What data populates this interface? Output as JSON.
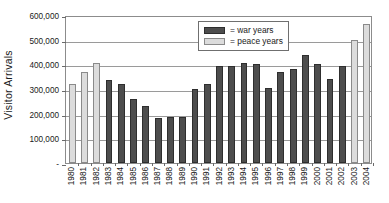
{
  "chart_data": {
    "type": "bar",
    "title": "",
    "subtitle": "",
    "xlabel": "",
    "ylabel": "Visitor Arrivals",
    "ylim": [
      0,
      600000
    ],
    "ytick_labels": [
      "600,000",
      "500,000",
      "400,000",
      "300,000",
      "200,000",
      "100,000",
      "-"
    ],
    "ytick_values": [
      600000,
      500000,
      400000,
      300000,
      200000,
      100000,
      0
    ],
    "grid": "horizontal",
    "legend_position": "upper-center",
    "legend": [
      {
        "key": "war",
        "label": "= war years",
        "color": "#4d4d4d"
      },
      {
        "key": "peace",
        "label": "= peace years",
        "color": "#dcdcdc"
      }
    ],
    "categories": [
      "1980",
      "1981",
      "1982",
      "1983",
      "1984",
      "1985",
      "1986",
      "1987",
      "1988",
      "1989",
      "1990",
      "1991",
      "1992",
      "1993",
      "1994",
      "1995",
      "1996",
      "1997",
      "1998",
      "1999",
      "2000",
      "2001",
      "2002",
      "2003",
      "2004"
    ],
    "values": [
      320000,
      371000,
      405000,
      338000,
      322000,
      259000,
      233000,
      183000,
      185000,
      187000,
      300000,
      320000,
      392000,
      394000,
      407000,
      402000,
      306000,
      368000,
      380000,
      439000,
      401000,
      340000,
      395000,
      500000,
      565000
    ],
    "bar_types": [
      "peace",
      "peace",
      "peace",
      "war",
      "war",
      "war",
      "war",
      "war",
      "war",
      "war",
      "war",
      "war",
      "war",
      "war",
      "war",
      "war",
      "war",
      "war",
      "war",
      "war",
      "war",
      "war",
      "war",
      "peace",
      "peace"
    ]
  }
}
